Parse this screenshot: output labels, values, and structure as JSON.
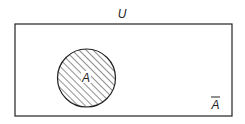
{
  "diagram": {
    "type": "venn",
    "universe_label": "U",
    "set_label": "A",
    "complement_label": "A",
    "complement_overline": true,
    "colors": {
      "stroke": "#222222",
      "background": "#ffffff",
      "hatch": "#222222"
    }
  }
}
